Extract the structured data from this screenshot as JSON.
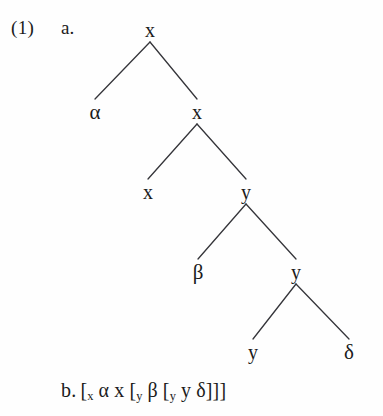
{
  "figure": {
    "example_number": "(1)",
    "sub_a": "a.",
    "sub_b": "b."
  },
  "tree": {
    "nodes": [
      {
        "id": "n0",
        "label": "x",
        "x": 150,
        "y": 30,
        "kind": "variable"
      },
      {
        "id": "n1",
        "label": "α",
        "x": 95,
        "y": 112,
        "kind": "greek"
      },
      {
        "id": "n2",
        "label": "x",
        "x": 197,
        "y": 112,
        "kind": "variable"
      },
      {
        "id": "n3",
        "label": "x",
        "x": 148,
        "y": 192,
        "kind": "variable"
      },
      {
        "id": "n4",
        "label": "y",
        "x": 246,
        "y": 192,
        "kind": "variable"
      },
      {
        "id": "n5",
        "label": "β",
        "x": 198,
        "y": 272,
        "kind": "greek"
      },
      {
        "id": "n6",
        "label": "y",
        "x": 296,
        "y": 272,
        "kind": "variable"
      },
      {
        "id": "n7",
        "label": "y",
        "x": 253,
        "y": 352,
        "kind": "variable"
      },
      {
        "id": "n8",
        "label": "δ",
        "x": 349,
        "y": 352,
        "kind": "greek"
      }
    ],
    "edges": [
      {
        "from": "n0",
        "to": "n1"
      },
      {
        "from": "n0",
        "to": "n2"
      },
      {
        "from": "n2",
        "to": "n3"
      },
      {
        "from": "n2",
        "to": "n4"
      },
      {
        "from": "n4",
        "to": "n5"
      },
      {
        "from": "n4",
        "to": "n6"
      },
      {
        "from": "n6",
        "to": "n7"
      },
      {
        "from": "n6",
        "to": "n8"
      }
    ],
    "line_color": "#35353a",
    "line_width": 1.3
  },
  "bracket_notation": {
    "parts": [
      {
        "text": "[",
        "sub": "x"
      },
      {
        "text": "α",
        "sub": ""
      },
      {
        "text": "x",
        "sub": ""
      },
      {
        "text": "[",
        "sub": "y"
      },
      {
        "text": "β",
        "sub": ""
      },
      {
        "text": "[",
        "sub": "y"
      },
      {
        "text": "y",
        "sub": ""
      },
      {
        "text": "δ]]]",
        "sub": ""
      }
    ],
    "plain": "[x α x [y β [y y δ]]]"
  }
}
